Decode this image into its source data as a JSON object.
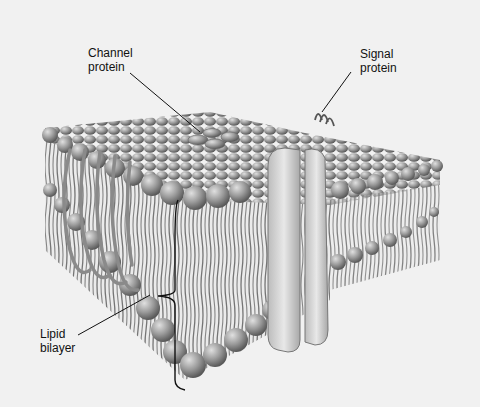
{
  "diagram": {
    "labels": {
      "channel_protein": [
        "Channel",
        "protein"
      ],
      "signal_protein": [
        "Signal",
        "protein"
      ],
      "lipid_bilayer": [
        "Lipid",
        "bilayer"
      ]
    },
    "colors": {
      "background": "#f1f1f1",
      "head": "#9a9a9a",
      "tail": "#3a3a3a",
      "protein": "#d6d6d6",
      "line": "#111111"
    }
  }
}
